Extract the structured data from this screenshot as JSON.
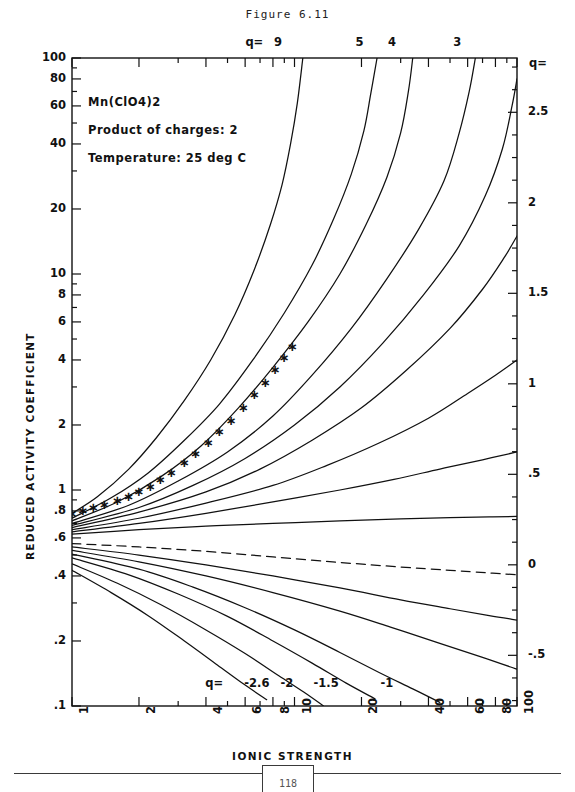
{
  "figure": {
    "title": "Figure 6.11",
    "page_number": "118"
  },
  "annotations": {
    "compound": "Mn(ClO4)2",
    "product_of_charges": "Product of charges: 2",
    "temperature": "Temperature: 25 deg C"
  },
  "chart_data": {
    "type": "line",
    "title": "Figure 6.11",
    "xlabel": "IONIC STRENGTH",
    "ylabel": "REDUCED ACTIVITY COEFFICIENT",
    "right_axis_label": "q=",
    "xscale": "log",
    "yscale": "log",
    "xlim": [
      1,
      100
    ],
    "ylim": [
      0.1,
      100
    ],
    "grid": false,
    "legend": "curve-end labels",
    "xticks": [
      {
        "value": 1,
        "label": "1"
      },
      {
        "value": 2,
        "label": "2"
      },
      {
        "value": 4,
        "label": "4"
      },
      {
        "value": 6,
        "label": "6"
      },
      {
        "value": 8,
        "label": "8"
      },
      {
        "value": 10,
        "label": "10"
      },
      {
        "value": 20,
        "label": "20"
      },
      {
        "value": 40,
        "label": "40"
      },
      {
        "value": 60,
        "label": "60"
      },
      {
        "value": 80,
        "label": "80"
      },
      {
        "value": 100,
        "label": "100"
      }
    ],
    "yticks": [
      {
        "value": 100,
        "label": "100"
      },
      {
        "value": 80,
        "label": "80"
      },
      {
        "value": 60,
        "label": "60"
      },
      {
        "value": 40,
        "label": "40"
      },
      {
        "value": 20,
        "label": "20"
      },
      {
        "value": 10,
        "label": "10"
      },
      {
        "value": 8,
        "label": "8"
      },
      {
        "value": 6,
        "label": "6"
      },
      {
        "value": 4,
        "label": "4"
      },
      {
        "value": 2,
        "label": "2"
      },
      {
        "value": 1,
        "label": "1"
      },
      {
        "value": 0.8,
        "label": ".8"
      },
      {
        "value": 0.6,
        "label": ".6"
      },
      {
        "value": 0.4,
        "label": ".4"
      },
      {
        "value": 0.2,
        "label": ".2"
      },
      {
        "value": 0.1,
        "label": ".1"
      }
    ],
    "right_axis_ticks": [
      {
        "value": 2.5,
        "label": "2.5"
      },
      {
        "value": 2,
        "label": "2"
      },
      {
        "value": 1.5,
        "label": "1.5"
      },
      {
        "value": 1,
        "label": "1"
      },
      {
        "value": 0.5,
        "label": ".5"
      },
      {
        "value": 0,
        "label": "0"
      },
      {
        "value": -0.5,
        "label": "-.5"
      }
    ],
    "top_labels": [
      {
        "text": "q=",
        "x": 6.4
      },
      {
        "text": "9",
        "x": 8.6
      },
      {
        "text": "5",
        "x": 20.0
      },
      {
        "text": "4",
        "x": 28.0
      },
      {
        "text": "3",
        "x": 55.0
      }
    ],
    "bottom_labels": [
      {
        "text": "q=",
        "x": 4.4
      },
      {
        "text": "-2.6",
        "x": 6.6
      },
      {
        "text": "-2",
        "x": 9.6
      },
      {
        "text": "-1.5",
        "x": 13.5
      },
      {
        "text": "-1",
        "x": 27.0
      }
    ],
    "series": [
      {
        "name": "q=9",
        "q": 9,
        "style": "solid",
        "y_at_1": 0.78,
        "points": [
          [
            1,
            0.78
          ],
          [
            1.3,
            0.93
          ],
          [
            1.8,
            1.25
          ],
          [
            2.4,
            1.75
          ],
          [
            3.2,
            2.6
          ],
          [
            4.2,
            4.0
          ],
          [
            5.4,
            6.5
          ],
          [
            6.6,
            10.5
          ],
          [
            7.8,
            17
          ],
          [
            8.8,
            26
          ],
          [
            9.6,
            40
          ],
          [
            10.3,
            62
          ],
          [
            10.9,
            100
          ]
        ]
      },
      {
        "name": "q=5",
        "q": 5,
        "style": "solid",
        "y_at_1": 0.74,
        "points": [
          [
            1,
            0.74
          ],
          [
            1.5,
            0.92
          ],
          [
            2.2,
            1.2
          ],
          [
            3.2,
            1.7
          ],
          [
            4.6,
            2.5
          ],
          [
            6.5,
            4.0
          ],
          [
            9,
            6.6
          ],
          [
            12,
            11
          ],
          [
            15,
            18
          ],
          [
            18,
            29
          ],
          [
            20.5,
            46
          ],
          [
            22,
            68
          ],
          [
            23.5,
            100
          ]
        ]
      },
      {
        "name": "q=4",
        "q": 4,
        "style": "solid",
        "y_at_1": 0.72,
        "points": [
          [
            1,
            0.72
          ],
          [
            1.6,
            0.88
          ],
          [
            2.5,
            1.15
          ],
          [
            3.8,
            1.6
          ],
          [
            5.6,
            2.4
          ],
          [
            8,
            3.7
          ],
          [
            11.5,
            6.0
          ],
          [
            16,
            10
          ],
          [
            21,
            17
          ],
          [
            26,
            28
          ],
          [
            30,
            45
          ],
          [
            32.5,
            70
          ],
          [
            34,
            100
          ]
        ]
      },
      {
        "name": "q=3",
        "q": 3,
        "style": "solid",
        "y_at_1": 0.7,
        "points": [
          [
            1,
            0.7
          ],
          [
            1.8,
            0.85
          ],
          [
            3,
            1.1
          ],
          [
            5,
            1.5
          ],
          [
            8,
            2.2
          ],
          [
            12,
            3.4
          ],
          [
            18,
            5.6
          ],
          [
            26,
            9.5
          ],
          [
            36,
            16
          ],
          [
            47,
            27
          ],
          [
            55,
            45
          ],
          [
            61,
            70
          ],
          [
            65,
            100
          ]
        ]
      },
      {
        "name": "q=2.5",
        "q": 2.5,
        "style": "solid",
        "y_at_1": 0.685,
        "points": [
          [
            1,
            0.685
          ],
          [
            2,
            0.83
          ],
          [
            3.5,
            1.05
          ],
          [
            6,
            1.4
          ],
          [
            10,
            2.0
          ],
          [
            16,
            3.0
          ],
          [
            25,
            4.8
          ],
          [
            38,
            8.0
          ],
          [
            55,
            13.5
          ],
          [
            72,
            23
          ],
          [
            86,
            38
          ],
          [
            95,
            60
          ],
          [
            100,
            80
          ]
        ]
      },
      {
        "name": "q=2",
        "q": 2,
        "style": "solid",
        "y_at_1": 0.67,
        "points": [
          [
            1,
            0.67
          ],
          [
            2,
            0.79
          ],
          [
            4,
            0.98
          ],
          [
            7,
            1.25
          ],
          [
            12,
            1.7
          ],
          [
            20,
            2.4
          ],
          [
            32,
            3.6
          ],
          [
            50,
            5.6
          ],
          [
            70,
            8.5
          ],
          [
            88,
            12
          ],
          [
            100,
            15
          ]
        ]
      },
      {
        "name": "q=1.5",
        "q": 1.5,
        "style": "solid",
        "y_at_1": 0.655,
        "points": [
          [
            1,
            0.655
          ],
          [
            2,
            0.74
          ],
          [
            4,
            0.87
          ],
          [
            8,
            1.05
          ],
          [
            14,
            1.3
          ],
          [
            24,
            1.65
          ],
          [
            40,
            2.15
          ],
          [
            60,
            2.8
          ],
          [
            80,
            3.4
          ],
          [
            100,
            4.0
          ]
        ]
      },
      {
        "name": "q=1",
        "q": 1,
        "style": "solid",
        "y_at_1": 0.64,
        "points": [
          [
            1,
            0.64
          ],
          [
            2,
            0.7
          ],
          [
            4,
            0.78
          ],
          [
            8,
            0.88
          ],
          [
            16,
            1.0
          ],
          [
            28,
            1.12
          ],
          [
            45,
            1.25
          ],
          [
            70,
            1.38
          ],
          [
            100,
            1.5
          ]
        ]
      },
      {
        "name": "q=0.5",
        "q": 0.5,
        "style": "solid",
        "y_at_1": 0.625,
        "points": [
          [
            1,
            0.625
          ],
          [
            2,
            0.655
          ],
          [
            4,
            0.68
          ],
          [
            8,
            0.7
          ],
          [
            16,
            0.72
          ],
          [
            30,
            0.735
          ],
          [
            50,
            0.745
          ],
          [
            75,
            0.75
          ],
          [
            100,
            0.755
          ]
        ]
      },
      {
        "name": "q=0",
        "q": 0,
        "style": "dashed",
        "y_at_1": 0.57,
        "points": [
          [
            1,
            0.565
          ],
          [
            2,
            0.545
          ],
          [
            4,
            0.52
          ],
          [
            8,
            0.49
          ],
          [
            16,
            0.462
          ],
          [
            30,
            0.44
          ],
          [
            50,
            0.425
          ],
          [
            75,
            0.413
          ],
          [
            100,
            0.405
          ]
        ]
      },
      {
        "name": "q=-0.5",
        "q": -0.5,
        "style": "solid",
        "y_at_1": 0.545,
        "points": [
          [
            1,
            0.545
          ],
          [
            2,
            0.5
          ],
          [
            4,
            0.45
          ],
          [
            8,
            0.4
          ],
          [
            16,
            0.352
          ],
          [
            30,
            0.31
          ],
          [
            50,
            0.282
          ],
          [
            75,
            0.262
          ],
          [
            100,
            0.25
          ]
        ]
      },
      {
        "name": "q=-1",
        "q": -1,
        "style": "solid",
        "y_at_1": 0.525,
        "points": [
          [
            1,
            0.525
          ],
          [
            2,
            0.465
          ],
          [
            4,
            0.4
          ],
          [
            8,
            0.335
          ],
          [
            16,
            0.275
          ],
          [
            27,
            0.232
          ],
          [
            45,
            0.195
          ],
          [
            70,
            0.168
          ],
          [
            100,
            0.148
          ]
        ]
      },
      {
        "name": "q=-1.5",
        "q": -1.5,
        "style": "solid",
        "y_at_1": 0.505,
        "points": [
          [
            1,
            0.505
          ],
          [
            2,
            0.43
          ],
          [
            3.5,
            0.355
          ],
          [
            6,
            0.285
          ],
          [
            10,
            0.225
          ],
          [
            16,
            0.177
          ],
          [
            24,
            0.143
          ],
          [
            34,
            0.12
          ],
          [
            45,
            0.104
          ],
          [
            55,
            0.095
          ]
        ]
      },
      {
        "name": "q=-2",
        "q": -2,
        "style": "solid",
        "y_at_1": 0.485,
        "points": [
          [
            1,
            0.485
          ],
          [
            1.8,
            0.405
          ],
          [
            3,
            0.33
          ],
          [
            5,
            0.26
          ],
          [
            8,
            0.2
          ],
          [
            12,
            0.158
          ],
          [
            17,
            0.128
          ],
          [
            23,
            0.108
          ],
          [
            29,
            0.095
          ]
        ]
      },
      {
        "name": "q=-2.6",
        "q": -2.6,
        "style": "solid",
        "y_at_1": 0.455,
        "points": [
          [
            1,
            0.455
          ],
          [
            1.6,
            0.37
          ],
          [
            2.5,
            0.295
          ],
          [
            4,
            0.225
          ],
          [
            6,
            0.175
          ],
          [
            8.5,
            0.138
          ],
          [
            11,
            0.116
          ],
          [
            13.5,
            0.1
          ]
        ]
      },
      {
        "name": "q=-3",
        "q": -3,
        "style": "solid",
        "y_at_1": 0.425,
        "points": [
          [
            1,
            0.425
          ],
          [
            1.5,
            0.335
          ],
          [
            2.2,
            0.262
          ],
          [
            3.2,
            0.2
          ],
          [
            4.5,
            0.155
          ],
          [
            6,
            0.125
          ],
          [
            7.5,
            0.107
          ],
          [
            9,
            0.095
          ]
        ]
      }
    ],
    "data_points": {
      "marker": "asterisk",
      "name": "experimental",
      "points": [
        [
          1.0,
          0.78
        ],
        [
          1.12,
          0.8
        ],
        [
          1.25,
          0.825
        ],
        [
          1.4,
          0.855
        ],
        [
          1.6,
          0.89
        ],
        [
          1.8,
          0.93
        ],
        [
          2.0,
          0.98
        ],
        [
          2.25,
          1.04
        ],
        [
          2.5,
          1.11
        ],
        [
          2.8,
          1.2
        ],
        [
          3.2,
          1.33
        ],
        [
          3.6,
          1.47
        ],
        [
          4.1,
          1.65
        ],
        [
          4.6,
          1.85
        ],
        [
          5.2,
          2.1
        ],
        [
          5.9,
          2.4
        ],
        [
          6.6,
          2.75
        ],
        [
          7.4,
          3.15
        ],
        [
          8.2,
          3.6
        ],
        [
          9.0,
          4.1
        ],
        [
          9.8,
          4.6
        ]
      ]
    }
  }
}
